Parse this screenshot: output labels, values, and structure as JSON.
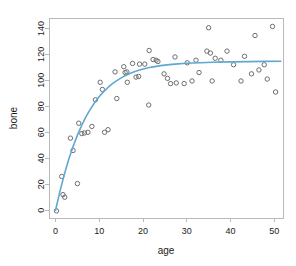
{
  "chart_data": {
    "type": "scatter",
    "title": "",
    "xlabel": "age",
    "ylabel": "bone",
    "xlim": [
      -1.5,
      52
    ],
    "ylim": [
      -6,
      148
    ],
    "xticks": [
      0,
      10,
      20,
      30,
      40,
      50
    ],
    "yticks": [
      0,
      20,
      40,
      60,
      80,
      100,
      120,
      140
    ],
    "grid": false,
    "legend": "none",
    "marker": "open-circle",
    "point_color": "#6e6e6e",
    "curve_color": "#5fa8d3",
    "series": [
      {
        "name": "bone",
        "type": "scatter",
        "points": [
          [
            0.2,
            -0.5
          ],
          [
            1.4,
            26.0
          ],
          [
            1.7,
            12.0
          ],
          [
            2.1,
            10.0
          ],
          [
            3.4,
            55.5
          ],
          [
            4.0,
            46.0
          ],
          [
            5.0,
            20.5
          ],
          [
            5.3,
            67.0
          ],
          [
            6.0,
            59.0
          ],
          [
            6.6,
            59.5
          ],
          [
            7.4,
            60.0
          ],
          [
            8.3,
            64.5
          ],
          [
            9.1,
            85.0
          ],
          [
            10.2,
            98.5
          ],
          [
            10.7,
            93.0
          ],
          [
            11.2,
            60.0
          ],
          [
            12.0,
            62.0
          ],
          [
            13.6,
            106.5
          ],
          [
            14.0,
            86.0
          ],
          [
            15.6,
            110.5
          ],
          [
            15.9,
            106.0
          ],
          [
            16.3,
            106.5
          ],
          [
            16.4,
            98.5
          ],
          [
            17.6,
            113.0
          ],
          [
            18.4,
            102.5
          ],
          [
            19.0,
            103.0
          ],
          [
            19.2,
            112.5
          ],
          [
            20.4,
            112.5
          ],
          [
            21.3,
            81.0
          ],
          [
            21.4,
            123.0
          ],
          [
            22.3,
            116.0
          ],
          [
            23.0,
            115.5
          ],
          [
            23.4,
            114.5
          ],
          [
            24.8,
            105.0
          ],
          [
            25.6,
            101.5
          ],
          [
            26.3,
            97.5
          ],
          [
            27.3,
            118.0
          ],
          [
            27.6,
            98.0
          ],
          [
            29.4,
            97.5
          ],
          [
            30.1,
            113.5
          ],
          [
            31.2,
            99.5
          ],
          [
            32.1,
            115.5
          ],
          [
            32.8,
            106.0
          ],
          [
            34.6,
            122.5
          ],
          [
            35.0,
            140.5
          ],
          [
            35.4,
            121.0
          ],
          [
            35.8,
            99.5
          ],
          [
            36.5,
            117.0
          ],
          [
            37.8,
            115.5
          ],
          [
            39.2,
            122.5
          ],
          [
            40.7,
            112.0
          ],
          [
            42.4,
            99.5
          ],
          [
            43.2,
            118.5
          ],
          [
            44.8,
            105.0
          ],
          [
            45.6,
            134.5
          ],
          [
            46.5,
            108.0
          ],
          [
            47.7,
            112.0
          ],
          [
            48.4,
            101.0
          ],
          [
            49.6,
            141.5
          ],
          [
            50.3,
            91.0
          ]
        ]
      },
      {
        "name": "fitted curve",
        "type": "line",
        "model": "asymptotic",
        "points": [
          [
            0.0,
            0.0
          ],
          [
            1.0,
            14.5
          ],
          [
            2.0,
            27.5
          ],
          [
            3.0,
            39.0
          ],
          [
            4.0,
            49.0
          ],
          [
            5.0,
            57.8
          ],
          [
            6.0,
            65.5
          ],
          [
            7.0,
            72.2
          ],
          [
            8.0,
            78.0
          ],
          [
            9.0,
            83.1
          ],
          [
            10.0,
            87.5
          ],
          [
            11.0,
            91.3
          ],
          [
            12.0,
            94.5
          ],
          [
            13.0,
            97.4
          ],
          [
            14.0,
            99.8
          ],
          [
            15.0,
            101.9
          ],
          [
            16.0,
            103.7
          ],
          [
            17.0,
            105.3
          ],
          [
            18.0,
            106.6
          ],
          [
            19.0,
            107.7
          ],
          [
            20.0,
            108.7
          ],
          [
            22.0,
            110.2
          ],
          [
            24.0,
            111.3
          ],
          [
            26.0,
            112.1
          ],
          [
            28.0,
            112.7
          ],
          [
            30.0,
            113.1
          ],
          [
            33.0,
            113.6
          ],
          [
            36.0,
            113.9
          ],
          [
            40.0,
            114.2
          ],
          [
            44.0,
            114.4
          ],
          [
            48.0,
            114.6
          ],
          [
            51.5,
            114.7
          ]
        ]
      }
    ]
  },
  "plot_frame": {
    "left_px": 49,
    "right_px": 283,
    "top_px": 18,
    "bottom_px": 218
  }
}
